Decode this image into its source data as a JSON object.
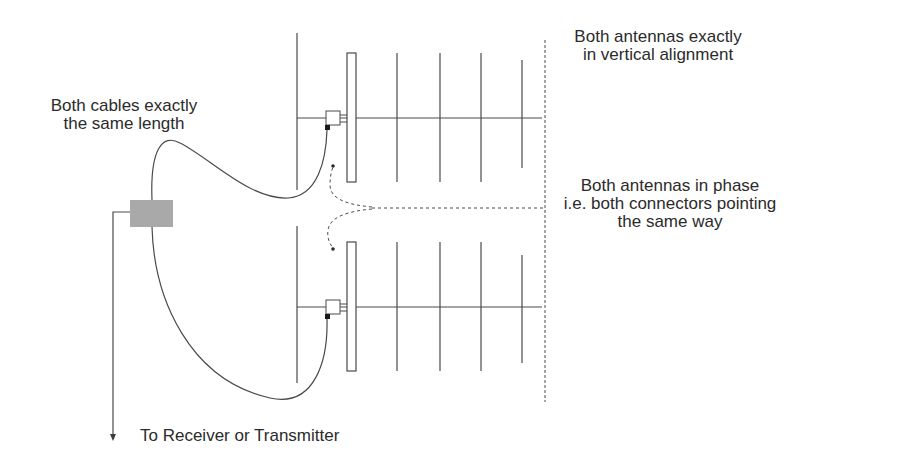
{
  "diagram": {
    "colors": {
      "line": "#4a4a4a",
      "text": "#2b2b2b",
      "splitter": "#a9a9a9",
      "connector_pin": "#1a1a1a",
      "background": "#ffffff"
    },
    "labels": {
      "cables": {
        "line1": "Both cables exactly",
        "line2": "the same length"
      },
      "alignment": {
        "line1": "Both antennas exactly",
        "line2": "in vertical alignment"
      },
      "phase": {
        "line1": "Both antennas in phase",
        "line2": "i.e. both connectors pointing",
        "line3": "the same way"
      },
      "feed": {
        "text": "To Receiver or Transmitter"
      }
    },
    "components": [
      {
        "name": "top-antenna",
        "type": "yagi",
        "elements": [
          "reflector",
          "driven-element",
          "director-1",
          "director-2",
          "director-3",
          "director-4"
        ]
      },
      {
        "name": "bottom-antenna",
        "type": "yagi",
        "elements": [
          "reflector",
          "driven-element",
          "director-1",
          "director-2",
          "director-3",
          "director-4"
        ]
      },
      {
        "name": "power-splitter",
        "type": "combiner"
      },
      {
        "name": "cable-top",
        "type": "coax"
      },
      {
        "name": "cable-bottom",
        "type": "coax"
      },
      {
        "name": "feed-line",
        "type": "coax",
        "direction": "down"
      },
      {
        "name": "vertical-alignment-line",
        "type": "dashed-reference"
      },
      {
        "name": "phase-indicator-arrows",
        "type": "dashed-arrows"
      }
    ]
  }
}
